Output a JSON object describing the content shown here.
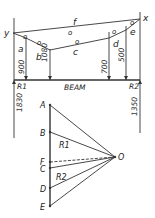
{
  "funicular": {
    "label_y": "y",
    "label_x": "x",
    "label_f": "f",
    "spaces": [
      "a",
      "b",
      "c",
      "d",
      "e"
    ],
    "beam_label": "BEAM",
    "loads": [
      {
        "value": "900",
        "x": 26
      },
      {
        "value": "1080",
        "x": 50
      },
      {
        "value": "700",
        "x": 109
      },
      {
        "value": "500",
        "x": 126
      }
    ],
    "reactions": [
      {
        "label": "R1",
        "value": "1830"
      },
      {
        "label": "R2",
        "value": "1350"
      }
    ],
    "o_marks": [
      "o",
      "o",
      "o",
      "o",
      "o",
      "o"
    ]
  },
  "force_diagram": {
    "points": [
      "A",
      "B",
      "F",
      "C",
      "D",
      "E"
    ],
    "pole": "O",
    "r1": "R1",
    "r2": "R2"
  },
  "colors": {
    "line": "#333333",
    "background": "#ffffff"
  }
}
